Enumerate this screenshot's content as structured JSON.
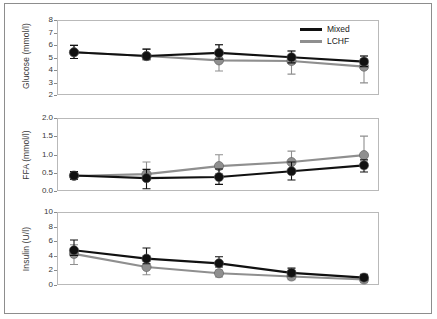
{
  "figure": {
    "legend": {
      "entries": [
        {
          "label": "Mixed",
          "color": "#111111"
        },
        {
          "label": "LCHF",
          "color": "#8f8f8f"
        }
      ]
    }
  },
  "chart_data": [
    {
      "type": "line",
      "panel": "glucose",
      "title": "",
      "ylabel": "Glucose (mmol/l)",
      "xlabel": "",
      "ylim": [
        2,
        8
      ],
      "yticks": [
        2,
        3,
        4,
        5,
        6,
        7,
        8
      ],
      "ytick_labels": [
        "2",
        "3",
        "4",
        "5",
        "6",
        "7",
        "8"
      ],
      "x": [
        1,
        2,
        3,
        4,
        5
      ],
      "grid": false,
      "series": [
        {
          "name": "Mixed",
          "color": "#111111",
          "values": [
            5.5,
            5.2,
            5.45,
            5.1,
            4.75
          ],
          "err_low": [
            5.0,
            4.9,
            4.95,
            4.65,
            4.35
          ],
          "err_high": [
            6.05,
            5.75,
            6.1,
            5.6,
            5.2
          ]
        },
        {
          "name": "LCHF",
          "color": "#8f8f8f",
          "values": [
            5.5,
            5.2,
            4.85,
            4.8,
            4.35
          ],
          "err_low": [
            5.0,
            4.9,
            4.0,
            3.75,
            3.05
          ],
          "err_high": [
            6.05,
            5.75,
            6.1,
            5.6,
            5.2
          ]
        }
      ]
    },
    {
      "type": "line",
      "panel": "ffa",
      "title": "",
      "ylabel": "FFA (mmol/l)",
      "xlabel": "",
      "ylim": [
        0.0,
        2.0
      ],
      "yticks": [
        0.0,
        0.5,
        1.0,
        1.5,
        2.0
      ],
      "ytick_labels": [
        "0.0",
        "0.5",
        "1.0",
        "1.5",
        "2.0"
      ],
      "x": [
        1,
        2,
        3,
        4,
        5
      ],
      "grid": false,
      "series": [
        {
          "name": "Mixed",
          "color": "#111111",
          "values": [
            0.45,
            0.38,
            0.41,
            0.57,
            0.73
          ],
          "err_low": [
            0.35,
            0.09,
            0.21,
            0.33,
            0.55
          ],
          "err_high": [
            0.56,
            0.62,
            0.63,
            0.82,
            0.88
          ]
        },
        {
          "name": "LCHF",
          "color": "#8f8f8f",
          "values": [
            0.44,
            0.49,
            0.71,
            0.82,
            1.01
          ],
          "err_low": [
            0.35,
            0.34,
            0.5,
            0.62,
            0.82
          ],
          "err_high": [
            0.56,
            0.82,
            1.02,
            1.12,
            1.53
          ]
        }
      ]
    },
    {
      "type": "line",
      "panel": "insulin",
      "title": "",
      "ylabel": "Insulin (U/l)",
      "xlabel": "",
      "ylim": [
        0,
        10
      ],
      "yticks": [
        0,
        2,
        4,
        6,
        8,
        10
      ],
      "ytick_labels": [
        "0",
        "2",
        "4",
        "6",
        "8",
        "10"
      ],
      "x": [
        1,
        2,
        3,
        4,
        5
      ],
      "grid": false,
      "series": [
        {
          "name": "Mixed",
          "color": "#111111",
          "values": [
            4.9,
            3.75,
            3.1,
            1.8,
            1.15
          ],
          "err_low": [
            4.2,
            3.05,
            2.6,
            1.35,
            0.8
          ],
          "err_high": [
            6.3,
            5.2,
            4.0,
            2.45,
            1.6
          ]
        },
        {
          "name": "LCHF",
          "color": "#8f8f8f",
          "values": [
            4.4,
            2.6,
            1.75,
            1.3,
            0.9
          ],
          "err_low": [
            2.95,
            1.55,
            1.25,
            0.85,
            0.45
          ],
          "err_high": [
            5.65,
            3.35,
            2.2,
            2.1,
            1.45
          ]
        }
      ]
    }
  ]
}
